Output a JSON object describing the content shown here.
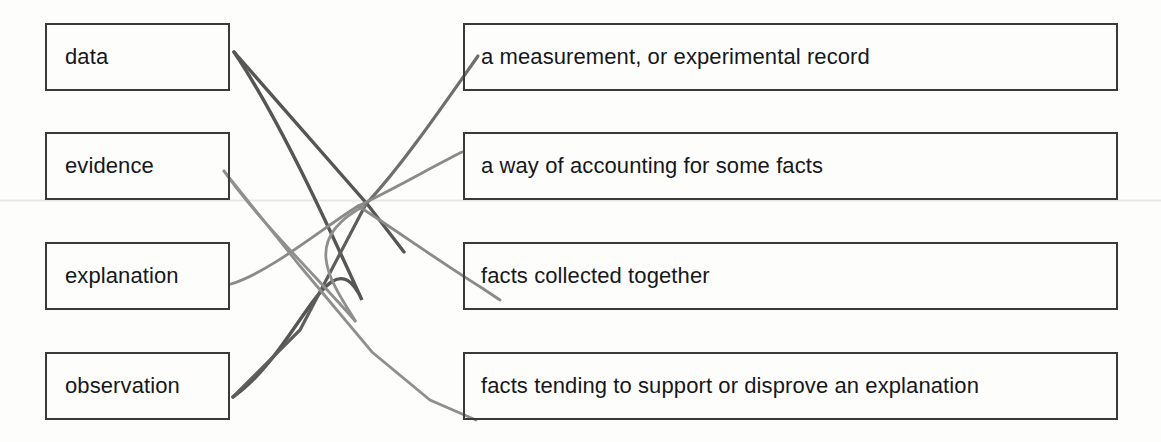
{
  "exercise": {
    "type": "matching-diagram",
    "left_column_label": "terms",
    "right_column_label": "definitions",
    "terms": [
      {
        "id": "data",
        "label": "data"
      },
      {
        "id": "evidence",
        "label": "evidence"
      },
      {
        "id": "explanation",
        "label": "explanation"
      },
      {
        "id": "observation",
        "label": "observation"
      }
    ],
    "definitions": [
      {
        "id": "measurement",
        "label": "a measurement, or experimental record"
      },
      {
        "id": "accounting",
        "label": "a way of accounting for some facts"
      },
      {
        "id": "collected",
        "label": "facts collected together"
      },
      {
        "id": "tending",
        "label": "facts tending to support or disprove an explanation"
      }
    ],
    "connections": [
      {
        "from": "data",
        "to": "observation-line-dark",
        "stroke": "#565656"
      },
      {
        "from": "observation",
        "to": "measurement",
        "stroke": "#6f6f6f"
      },
      {
        "from": "explanation",
        "to": "accounting",
        "stroke": "#8a8a8a"
      },
      {
        "from": "evidence",
        "to": "tending",
        "stroke": "#8f8f8f"
      },
      {
        "from": "collected",
        "to": "crossing",
        "stroke": "#8a8a8a"
      }
    ],
    "colors": {
      "background": "#fdfdfc",
      "box_border": "#3a3a3a",
      "text": "#16181a",
      "line_dark": "#565656",
      "line_mid": "#6f6f6f",
      "line_light": "#8f8f8f"
    }
  }
}
